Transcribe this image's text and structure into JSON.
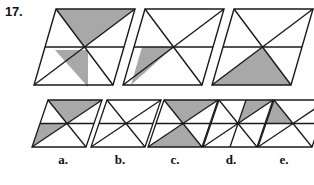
{
  "question": {
    "number": "17.",
    "type": "figure-analogy-multiple-choice"
  },
  "style": {
    "shade_color": "#a8a8a8",
    "stroke_color": "#1a1a1a",
    "background_color": "#ffffff"
  },
  "sequence": {
    "count": 3,
    "items": [
      {
        "index": 1,
        "shape": "parallelogram",
        "divisions": "horizontal-midline-plus-4-corner-diagonals",
        "triangle_count": 6,
        "shaded_regions": [
          "top-right"
        ],
        "shaded_count": 1
      },
      {
        "index": 2,
        "shape": "parallelogram",
        "divisions": "horizontal-midline-plus-4-corner-diagonals",
        "triangle_count": 6,
        "shaded_regions": [
          "bottom-left"
        ],
        "shaded_count": 1
      },
      {
        "index": 3,
        "shape": "parallelogram",
        "divisions": "horizontal-midline-plus-4-corner-diagonals",
        "triangle_count": 6,
        "shaded_regions": [
          "bottom-right"
        ],
        "shaded_count": 1
      }
    ]
  },
  "options": {
    "count": 5,
    "items": [
      {
        "letter": "a.",
        "shape": "parallelogram",
        "divisions": "horizontal-midline-plus-4-corner-diagonals",
        "shaded_regions": [
          "top-right",
          "bottom-left"
        ],
        "shaded_count": 2
      },
      {
        "letter": "b.",
        "shape": "parallelogram",
        "divisions": "horizontal-midline-plus-4-corner-diagonals",
        "shaded_regions": [],
        "shaded_count": 0
      },
      {
        "letter": "c.",
        "shape": "parallelogram",
        "divisions": "horizontal-midline-plus-4-corner-diagonals",
        "shaded_regions": [
          "top-center",
          "bottom-center"
        ],
        "shaded_count": 2
      },
      {
        "letter": "d.",
        "shape": "parallelogram",
        "divisions": "horizontal-midline-plus-4-corner-diagonals-plus-center-verticals",
        "shaded_regions": [
          "upper-right-inner"
        ],
        "shaded_count": 1
      },
      {
        "letter": "e.",
        "shape": "parallelogram",
        "divisions": "horizontal-midline-plus-4-corner-diagonals",
        "shaded_regions": [
          "top-left"
        ],
        "shaded_count": 1
      }
    ]
  }
}
